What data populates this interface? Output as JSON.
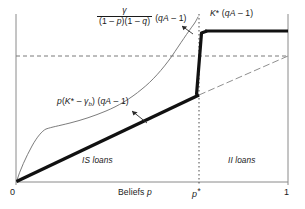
{
  "figure": {
    "axes": {
      "x_title": "Beliefs p",
      "x_ticks": [
        "0",
        "p*",
        "1"
      ]
    },
    "annotations": {
      "formula_numerator": "γ",
      "formula_denominator": "(1 – p)(1 – q)",
      "formula_tail": "(qA – 1)",
      "kstar_label": "K* (qA – 1)",
      "pk_label": "p(K* – γb) (qA – 1)",
      "region_left": "IS loans",
      "region_right": "II loans"
    },
    "colors": {
      "ink": "#1a1a1a",
      "axis": "#8a8a8a",
      "thin_curve": "#6d6d6d",
      "dash": "#7a7a7a"
    }
  },
  "chart_data": {
    "type": "line",
    "title": "",
    "xlabel": "Beliefs p",
    "ylabel": "",
    "xlim": [
      0,
      1
    ],
    "ylim": [
      0,
      1
    ],
    "grid": false,
    "legend": "none",
    "x_tick_values": [
      0,
      0.675,
      1
    ],
    "x_tick_labels": [
      "0",
      "p*",
      "1"
    ],
    "annotations": [
      {
        "text": "γ / ((1 – p)(1 – q)) (qA – 1)",
        "role": "steep-curve-label",
        "at_x": 0.3,
        "at_y": 0.92,
        "leader_to": [
          0.67,
          0.78
        ]
      },
      {
        "text": "K* (qA – 1)",
        "role": "plateau-label",
        "at_x": 0.8,
        "at_y": 0.93
      },
      {
        "text": "p(K* – γb) (qA – 1)",
        "role": "thick-line-label",
        "at_x": 0.17,
        "at_y": 0.49,
        "leader_to": [
          0.53,
          0.37
        ]
      },
      {
        "text": "IS loans",
        "role": "region-label",
        "at_x": 0.32,
        "at_y": 0.16
      },
      {
        "text": "II loans",
        "role": "region-label",
        "at_x": 0.83,
        "at_y": 0.16
      }
    ],
    "series": [
      {
        "name": "K* (qA – 1) payoff (thick)",
        "style": "solid-thick",
        "comment": "linear p(K*-gamma_b)(qA-1) on [0,p*], jumps at p*, flat K*(qA-1) after",
        "points": [
          [
            0.0,
            0.0
          ],
          [
            0.675,
            0.52
          ],
          [
            0.675,
            0.52
          ],
          [
            0.69,
            0.905
          ],
          [
            0.72,
            0.93
          ],
          [
            1.0,
            0.93
          ]
        ]
      },
      {
        "name": "γ/((1–p)(1–q)) (qA – 1) (thin)",
        "style": "solid-thin",
        "points": [
          [
            0.0,
            0.0
          ],
          [
            0.03,
            0.075
          ],
          [
            0.07,
            0.155
          ],
          [
            0.11,
            0.235
          ],
          [
            0.15,
            0.283
          ],
          [
            0.2,
            0.3
          ],
          [
            0.26,
            0.325
          ],
          [
            0.32,
            0.36
          ],
          [
            0.38,
            0.4
          ],
          [
            0.44,
            0.448
          ],
          [
            0.5,
            0.505
          ],
          [
            0.55,
            0.565
          ],
          [
            0.6,
            0.645
          ],
          [
            0.635,
            0.72
          ],
          [
            0.655,
            0.79
          ],
          [
            0.668,
            0.855
          ],
          [
            0.675,
            0.905
          ],
          [
            0.678,
            0.94
          ]
        ]
      },
      {
        "name": "continuation reference (dash-dot)",
        "style": "dash-dot",
        "points": [
          [
            0.675,
            0.52
          ],
          [
            1.0,
            0.74
          ]
        ]
      }
    ],
    "reference_lines": [
      {
        "orientation": "horizontal",
        "value": 0.74,
        "style": "dashed",
        "label": ""
      },
      {
        "orientation": "vertical",
        "value": 0.675,
        "style": "dotted",
        "label": "p*"
      }
    ]
  }
}
